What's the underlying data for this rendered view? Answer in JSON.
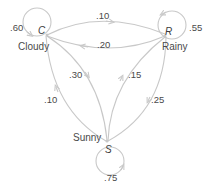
{
  "colors": {
    "edge": "#c8c8c8",
    "text": "#4a4a4a",
    "background": "#ffffff"
  },
  "states": [
    {
      "id": "C",
      "name": "Cloudy",
      "self_prob": ".60"
    },
    {
      "id": "R",
      "name": "Rainy",
      "self_prob": ".55"
    },
    {
      "id": "S",
      "name": "Sunny",
      "self_prob": ".75"
    }
  ],
  "transitions": [
    {
      "from": "C",
      "to": "R",
      "prob": ".10"
    },
    {
      "from": "R",
      "to": "C",
      "prob": ".20"
    },
    {
      "from": "C",
      "to": "S",
      "prob": ".30"
    },
    {
      "from": "S",
      "to": "R",
      "prob": ".15"
    },
    {
      "from": "S",
      "to": "C",
      "prob": ".10"
    },
    {
      "from": "R",
      "to": "S",
      "prob": ".25"
    }
  ]
}
